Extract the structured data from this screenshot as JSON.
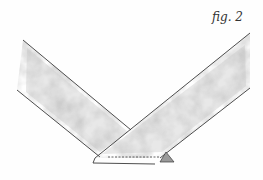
{
  "figure": {
    "label": "fig. 2"
  },
  "illustration": {
    "description": "Two fabric strips joined at a right angle with diagonal seam",
    "colors": {
      "line": "#3a3a3a",
      "fabric_dark": "#8c8c8c",
      "fabric_light": "#cfcfcf",
      "background": "#fefefe"
    },
    "elements": [
      "left-fabric-strip",
      "right-fabric-strip",
      "stitch-line",
      "seam-allowance-triangle"
    ]
  }
}
